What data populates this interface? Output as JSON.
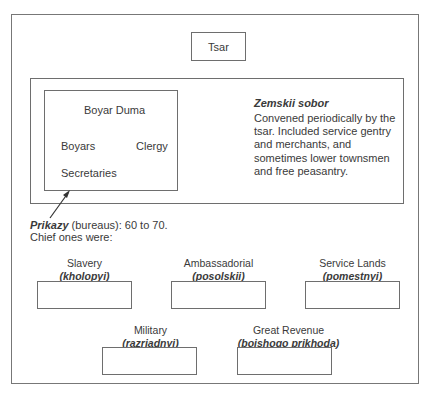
{
  "diagram": {
    "tsar": {
      "label": "Tsar"
    },
    "boyar_duma": {
      "title": "Boyar Duma",
      "members": [
        "Boyars",
        "Clergy",
        "Secretaries"
      ]
    },
    "zemskii_sobor": {
      "title": "Zemskii sobor",
      "description": "Convened periodically by the tsar. Included service gentry and merchants, and sometimes lower townsmen and free peasantry."
    },
    "prikazy": {
      "term": "Prikazy",
      "text": " (bureaus): 60 to 70.",
      "line2": "Chief ones were:"
    },
    "bureaus": [
      {
        "name": "Slavery",
        "russian": "(kholopyi)"
      },
      {
        "name": "Ambassadorial",
        "russian": "(posolskii)"
      },
      {
        "name": "Service Lands",
        "russian": "(pomestnyi)"
      },
      {
        "name": "Military",
        "russian": "(razriadnyi)"
      },
      {
        "name": "Great Revenue",
        "russian": "(boishogo prikhoda)"
      }
    ],
    "colors": {
      "line": "#6e6e6e",
      "text": "#3a3a3a",
      "background": "#ffffff"
    }
  }
}
